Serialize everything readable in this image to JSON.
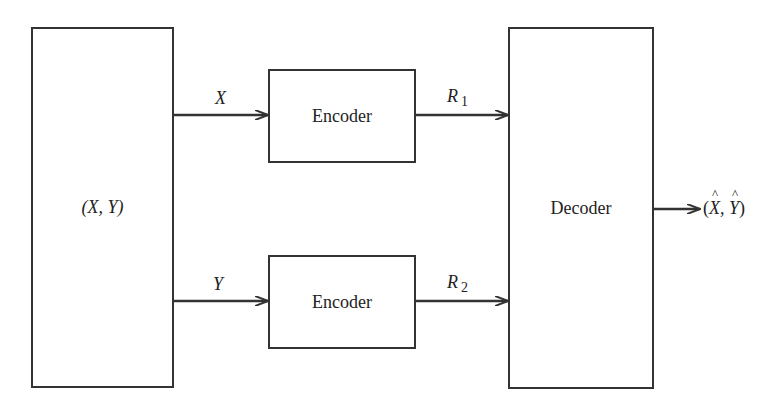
{
  "diagram": {
    "type": "block-diagram",
    "title": "",
    "source": {
      "label": "(X, Y)"
    },
    "encoders": [
      {
        "label": "Encoder",
        "input_label": "X",
        "output_label": "R",
        "output_subscript": "1"
      },
      {
        "label": "Encoder",
        "input_label": "Y",
        "output_label": "R",
        "output_subscript": "2"
      }
    ],
    "decoder": {
      "label": "Decoder"
    },
    "output": {
      "open": "(",
      "x": "X",
      "sep": ", ",
      "y": "Y",
      "close": ")"
    },
    "colors": {
      "stroke": "#333333",
      "background": "#ffffff",
      "text": "#222222"
    }
  }
}
